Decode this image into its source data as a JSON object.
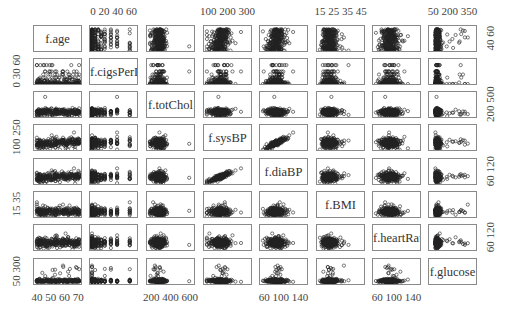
{
  "chart_data": {
    "type": "scatter",
    "title": "",
    "subtype": "scatterplot-matrix",
    "variables": [
      "f.age",
      "f.cigsPerDay",
      "f.totChol",
      "f.sysBP",
      "f.diaBP",
      "f.BMI",
      "f.heartRate",
      "f.glucose"
    ],
    "axes": {
      "top": [
        {
          "column": 1,
          "label": "0  20  40  60",
          "ticks": [
            0,
            20,
            40,
            60
          ]
        },
        {
          "column": 3,
          "label": "100  200  300",
          "ticks": [
            100,
            200,
            300
          ]
        },
        {
          "column": 5,
          "label": "15 25 35 45",
          "ticks": [
            15,
            25,
            35,
            45
          ]
        },
        {
          "column": 7,
          "label": "50  200  350",
          "ticks": [
            50,
            200,
            350
          ]
        }
      ],
      "bottom": [
        {
          "column": 0,
          "label": "40 50 60 70",
          "ticks": [
            40,
            50,
            60,
            70
          ]
        },
        {
          "column": 2,
          "label": "200  400  600",
          "ticks": [
            200,
            400,
            600
          ]
        },
        {
          "column": 4,
          "label": "60  100  140",
          "ticks": [
            60,
            100,
            140
          ]
        },
        {
          "column": 6,
          "label": "60  100  140",
          "ticks": [
            60,
            100,
            140
          ]
        }
      ],
      "left": [
        {
          "row": 1,
          "label": "0  30 60",
          "ticks": [
            0,
            30,
            60
          ]
        },
        {
          "row": 3,
          "label": "100 250",
          "ticks": [
            100,
            250
          ]
        },
        {
          "row": 5,
          "label": "15  35",
          "ticks": [
            15,
            35
          ]
        },
        {
          "row": 7,
          "label": "50  300",
          "ticks": [
            50,
            300
          ]
        }
      ],
      "right": [
        {
          "row": 0,
          "label": "40  60",
          "ticks": [
            40,
            60
          ]
        },
        {
          "row": 2,
          "label": "200  500",
          "ticks": [
            200,
            500
          ]
        },
        {
          "row": 4,
          "label": "60  120",
          "ticks": [
            60,
            120
          ]
        },
        {
          "row": 6,
          "label": "60  120",
          "ticks": [
            60,
            120
          ]
        }
      ]
    },
    "ranges": {
      "f.age": [
        32,
        70
      ],
      "f.cigsPerDay": [
        0,
        70
      ],
      "f.totChol": [
        107,
        696
      ],
      "f.sysBP": [
        83,
        295
      ],
      "f.diaBP": [
        48,
        143
      ],
      "f.BMI": [
        15,
        57
      ],
      "f.heartRate": [
        44,
        143
      ],
      "f.glucose": [
        40,
        394
      ]
    },
    "grid": false,
    "legend": null,
    "marker": "open circle",
    "marker_color": "#222222"
  },
  "layout": {
    "col_left": [
      33,
      89,
      146,
      203,
      259,
      316,
      372,
      428
    ],
    "row_top": [
      25,
      58,
      91,
      124,
      158,
      191,
      224,
      258
    ],
    "panel_w": 49,
    "panel_h": 27
  }
}
